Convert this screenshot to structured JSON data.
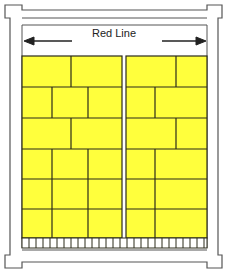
{
  "diagram": {
    "label": "Red Line",
    "arrow": "double-headed horizontal arrow spanning width",
    "colors": {
      "brick": "#ffff3c",
      "line": "#2a2a1a",
      "frame": "#444444",
      "background": "#ffffff"
    },
    "panels": [
      {
        "name": "left-panel",
        "x0": 22,
        "x1": 122,
        "rows": [
          {
            "y0": 56,
            "y1": 87,
            "splits": [
              71
            ]
          },
          {
            "y0": 87,
            "y1": 118,
            "splits": [
              52,
              88
            ]
          },
          {
            "y0": 118,
            "y1": 149,
            "splits": [
              71
            ]
          },
          {
            "y0": 149,
            "y1": 179,
            "splits": [
              52,
              88
            ]
          },
          {
            "y0": 179,
            "y1": 209,
            "splits": [
              52,
              88
            ]
          },
          {
            "y0": 209,
            "y1": 238,
            "splits": [
              52,
              88
            ]
          }
        ]
      },
      {
        "name": "right-panel",
        "x0": 126,
        "x1": 207,
        "rows": [
          {
            "y0": 56,
            "y1": 87,
            "splits": [
              176
            ]
          },
          {
            "y0": 87,
            "y1": 118,
            "splits": [
              155
            ]
          },
          {
            "y0": 118,
            "y1": 149,
            "splits": [
              176
            ]
          },
          {
            "y0": 149,
            "y1": 179,
            "splits": [
              155
            ]
          },
          {
            "y0": 179,
            "y1": 209,
            "splits": [
              155
            ]
          },
          {
            "y0": 209,
            "y1": 238,
            "splits": [
              155
            ]
          }
        ]
      }
    ],
    "base_strip": {
      "y0": 238,
      "y1": 248,
      "tick_spacing": 7
    }
  }
}
